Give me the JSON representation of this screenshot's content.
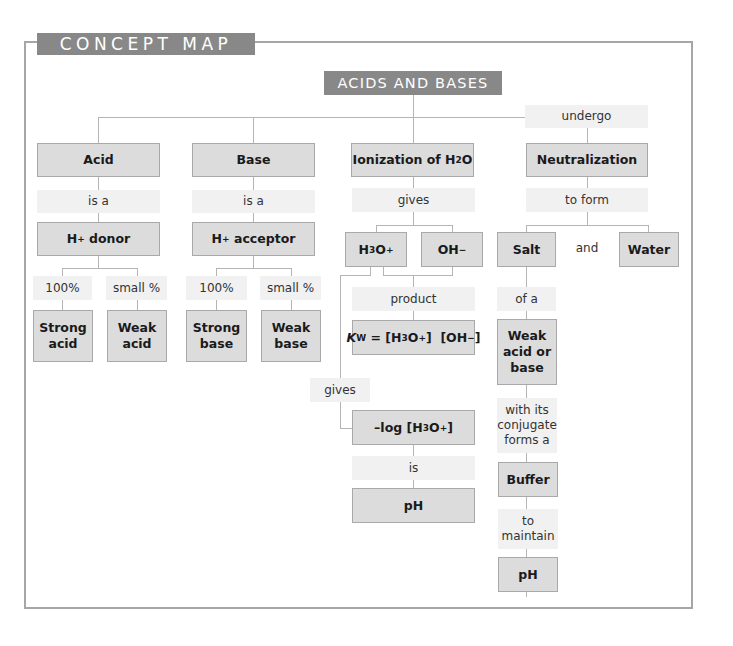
{
  "frame": {
    "title": "CONCEPT MAP"
  },
  "root": {
    "label": "ACIDS AND BASES"
  },
  "colors": {
    "header_bg": "#888888",
    "node_bg": "#dcdcdc",
    "link_bg": "#f1f1f1",
    "frame_border": "#a6a6a6",
    "line": "#b5b5b5"
  },
  "acid_branch": {
    "node": "Acid",
    "link1": "is a",
    "donor": {
      "prefix": "H",
      "sup": "+",
      "suffix": " donor"
    },
    "strong_link": "100%",
    "weak_link": "small %",
    "strong": [
      "Strong",
      "acid"
    ],
    "weak": [
      "Weak",
      "acid"
    ]
  },
  "base_branch": {
    "node": "Base",
    "link1": "is a",
    "acceptor": {
      "prefix": "H",
      "sup": "+",
      "suffix": " acceptor"
    },
    "strong_link": "100%",
    "weak_link": "small %",
    "strong": [
      "Strong",
      "base"
    ],
    "weak": [
      "Weak",
      "base"
    ]
  },
  "ionization_branch": {
    "node": {
      "prefix": "Ionization of H",
      "sub": "2",
      "suffix": "O"
    },
    "link_gives": "gives",
    "h3o": {
      "a": "H",
      "sub": "3",
      "b": "O",
      "sup": "+"
    },
    "oh": {
      "a": "OH",
      "sup": "−"
    },
    "link_product": "product",
    "kw": {
      "k": "K",
      "ksub": "W",
      "eq": " = [H",
      "sub": "3",
      "o": "O",
      "sup1": "+",
      "mid": "]  [OH",
      "sup2": "−",
      "end": "]"
    },
    "link_gives2": "gives",
    "neglog": {
      "a": "–log [H",
      "sub": "3",
      "b": "O",
      "sup": "+",
      "c": "]"
    },
    "link_is": "is",
    "ph": "pH"
  },
  "neutralization_branch": {
    "link_undergo": "undergo",
    "node": "Neutralization",
    "link_to_form": "to form",
    "salt": "Salt",
    "and": "and",
    "water": "Water",
    "link_of_a": "of a",
    "weak_acid_base": [
      "Weak",
      "acid or",
      "base"
    ],
    "link_conjugate": [
      "with its",
      "conjugate",
      "forms a"
    ],
    "buffer": "Buffer",
    "link_maintain": [
      "to",
      "maintain"
    ],
    "ph": "pH"
  }
}
